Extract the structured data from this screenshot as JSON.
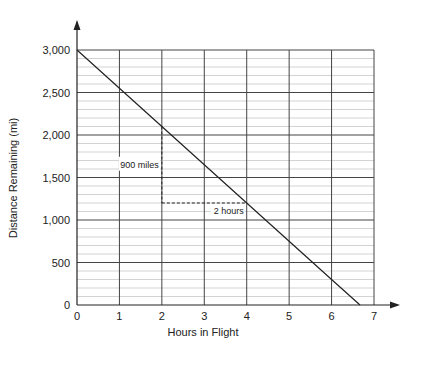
{
  "chart_data": {
    "type": "line",
    "title": "",
    "xlabel": "Hours in Flight",
    "ylabel": "Distance Remaining (mi)",
    "xlim": [
      0,
      7
    ],
    "ylim": [
      0,
      3000
    ],
    "x_ticks": [
      0,
      1,
      2,
      3,
      4,
      5,
      6,
      7
    ],
    "x_tick_labels": [
      "0",
      "1",
      "2",
      "3",
      "4",
      "5",
      "6",
      "7"
    ],
    "y_ticks": [
      0,
      500,
      1000,
      1500,
      2000,
      2500,
      3000
    ],
    "y_tick_labels": [
      "0",
      "500",
      "1,000",
      "1,500",
      "2,000",
      "2,500",
      "3,000"
    ],
    "minor_y_step": 100,
    "grid": true,
    "legend": "none",
    "series": [
      {
        "name": "Distance Remaining",
        "x": [
          0,
          1,
          2,
          3,
          4,
          5,
          6,
          6.67
        ],
        "y": [
          3000,
          2550,
          2100,
          1650,
          1200,
          750,
          300,
          0
        ]
      }
    ],
    "annotations": [
      {
        "type": "dashed-vertical",
        "x": 2,
        "y_from": 2100,
        "y_to": 1200,
        "label": "900 miles"
      },
      {
        "type": "dashed-horizontal",
        "y": 1200,
        "x_from": 2,
        "x_to": 4,
        "label": "2 hours"
      }
    ]
  }
}
